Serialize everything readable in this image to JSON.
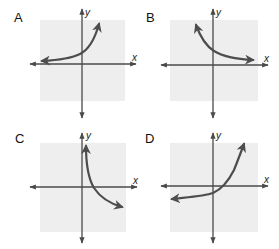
{
  "colors": {
    "grid_background": "#eeeeee",
    "axis": "#4a4a4a",
    "curve": "#4d4d4d",
    "label": "#111111"
  },
  "panels": [
    {
      "id": "A",
      "label": "A",
      "x_axis_label": "x",
      "y_axis_label": "y",
      "description": "exponential growth, approaches x-axis from above as x→-∞, rises steeply to the right",
      "box": [
        40,
        20,
        125,
        101
      ],
      "origin": [
        82,
        64
      ],
      "x_axis": [
        30,
        136
      ],
      "y_axis": [
        9,
        118
      ],
      "label_pos": [
        14,
        11
      ],
      "x_label_pos": [
        133,
        53
      ],
      "y_label_pos": [
        85,
        9
      ],
      "curve": "M42,61 C60,60 72,58 80,54 C88,50 94,42 99,24",
      "arrow_start": true,
      "arrow_end": true
    },
    {
      "id": "B",
      "label": "B",
      "x_axis_label": "x",
      "y_axis_label": "y",
      "description": "exponential decay, rises steeply to the left, approaches x-axis from above as x→+∞",
      "box": [
        170,
        20,
        258,
        101
      ],
      "origin": [
        213,
        65
      ],
      "x_axis": [
        161,
        268
      ],
      "y_axis": [
        9,
        118
      ],
      "label_pos": [
        146,
        11
      ],
      "x_label_pos": [
        265,
        54
      ],
      "y_label_pos": [
        216,
        9
      ],
      "curve": "M196,25 C200,36 206,46 214,51 C222,56 232,59 253,60",
      "arrow_start": true,
      "arrow_end": true
    },
    {
      "id": "C",
      "label": "C",
      "x_axis_label": "x",
      "y_axis_label": "y",
      "description": "logarithmic-like decreasing curve, approaches y-axis upward as x→0+, decreases to the right crossing x-axis",
      "box": [
        40,
        143,
        126,
        232
      ],
      "origin": [
        82,
        187
      ],
      "x_axis": [
        30,
        137
      ],
      "y_axis": [
        133,
        243
      ],
      "label_pos": [
        15,
        132
      ],
      "x_label_pos": [
        133,
        176
      ],
      "y_label_pos": [
        86,
        132
      ],
      "curve": "M86,146 C86,165 88,178 94,188 C100,197 108,203 122,207",
      "arrow_start": true,
      "arrow_end": true
    },
    {
      "id": "D",
      "label": "D",
      "x_axis_label": "x",
      "y_axis_label": "y",
      "description": "exponential growth shifted down, horizontal asymptote below x-axis, crosses x-axis right of origin",
      "box": [
        170,
        143,
        258,
        232
      ],
      "origin": [
        213,
        186
      ],
      "x_axis": [
        161,
        268
      ],
      "y_axis": [
        133,
        243
      ],
      "label_pos": [
        145,
        132
      ],
      "x_label_pos": [
        265,
        175
      ],
      "y_label_pos": [
        216,
        132
      ],
      "curve": "M172,199 C190,197 205,196 213,193 C222,189 228,182 234,170 C238,160 241,152 244,144",
      "arrow_start": true,
      "arrow_end": true
    }
  ]
}
